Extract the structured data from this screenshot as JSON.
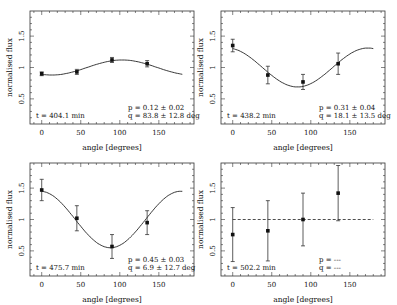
{
  "chart_data": [
    {
      "type": "scatter",
      "panel": "top-left",
      "xlabel": "angle [degrees]",
      "ylabel": "normalised flux",
      "xticks": [
        0,
        50,
        100,
        150
      ],
      "yticks": [
        0.5,
        1,
        1.5
      ],
      "xlim": [
        -15,
        195
      ],
      "ylim": [
        0.1,
        1.9
      ],
      "x": [
        0,
        45,
        90,
        135
      ],
      "y": [
        0.9,
        0.93,
        1.12,
        1.06
      ],
      "yerr": [
        0.03,
        0.04,
        0.04,
        0.05
      ],
      "fit": {
        "type": "cosine",
        "amplitude": 0.12,
        "phase_deg": 103,
        "mean": 1.0
      },
      "annotation_t": "t = 404.1 min",
      "annotation_p": "p = 0.12 ± 0.02",
      "annotation_q": "q = 83.8 ± 12.8 deg"
    },
    {
      "type": "scatter",
      "panel": "top-right",
      "xlabel": "angle [degrees]",
      "ylabel": "normalised flux",
      "xticks": [
        0,
        50,
        100,
        150
      ],
      "yticks": [
        0.5,
        1,
        1.5
      ],
      "xlim": [
        -15,
        195
      ],
      "ylim": [
        0.1,
        1.9
      ],
      "x": [
        0,
        45,
        90,
        135
      ],
      "y": [
        1.35,
        0.88,
        0.77,
        1.06
      ],
      "yerr": [
        0.1,
        0.14,
        0.12,
        0.17
      ],
      "fit": {
        "type": "cosine",
        "amplitude": 0.31,
        "phase_deg": 173,
        "mean": 1.0
      },
      "annotation_t": "t = 438.2 min",
      "annotation_p": "p = 0.31 ± 0.04",
      "annotation_q": "q = 18.1 ± 13.5 deg"
    },
    {
      "type": "scatter",
      "panel": "bottom-left",
      "xlabel": "angle [degrees]",
      "ylabel": "normalised flux",
      "xticks": [
        0,
        50,
        100,
        150
      ],
      "yticks": [
        0.5,
        1,
        1.5
      ],
      "xlim": [
        -15,
        195
      ],
      "ylim": [
        0.1,
        1.9
      ],
      "x": [
        0,
        45,
        90,
        135
      ],
      "y": [
        1.47,
        1.02,
        0.57,
        0.95
      ],
      "yerr": [
        0.17,
        0.2,
        0.19,
        0.19
      ],
      "fit": {
        "type": "cosine",
        "amplitude": 0.45,
        "phase_deg": 178,
        "mean": 1.0
      },
      "annotation_t": "t = 475.7 min",
      "annotation_p": "p = 0.45 ± 0.03",
      "annotation_q": "q = 6.9 ± 12.7 deg"
    },
    {
      "type": "scatter",
      "panel": "bottom-right",
      "xlabel": "angle [degrees]",
      "ylabel": "normalised flux",
      "xticks": [
        0,
        50,
        100,
        150
      ],
      "yticks": [
        0.5,
        1,
        1.5
      ],
      "xlim": [
        -15,
        195
      ],
      "ylim": [
        0.1,
        1.9
      ],
      "x": [
        0,
        45,
        90,
        135
      ],
      "y": [
        0.76,
        0.82,
        1.0,
        1.42
      ],
      "yerr": [
        0.43,
        0.48,
        0.42,
        0.44
      ],
      "fit": {
        "type": "constant",
        "value": 1.0,
        "style": "dashed"
      },
      "annotation_t": "t = 502.2 min",
      "annotation_p": "p = ---",
      "annotation_q": "q = ---"
    }
  ],
  "labels": {
    "xlabel": "angle [degrees]",
    "ylabel": "normalised flux",
    "xtick_labels": [
      "0",
      "50",
      "100",
      "150"
    ],
    "ytick_labels": [
      "0.5",
      "1",
      "1.5"
    ]
  },
  "panels": [
    {
      "t": "t = 404.1 min",
      "p": "p = 0.12 ± 0.02",
      "q": "q = 83.8 ± 12.8 deg"
    },
    {
      "t": "t = 438.2 min",
      "p": "p = 0.31 ± 0.04",
      "q": "q = 18.1 ± 13.5 deg"
    },
    {
      "t": "t = 475.7 min",
      "p": "p = 0.45 ± 0.03",
      "q": "q = 6.9 ± 12.7 deg"
    },
    {
      "t": "t = 502.2 min",
      "p": "p = ---",
      "q": "q = ---"
    }
  ]
}
